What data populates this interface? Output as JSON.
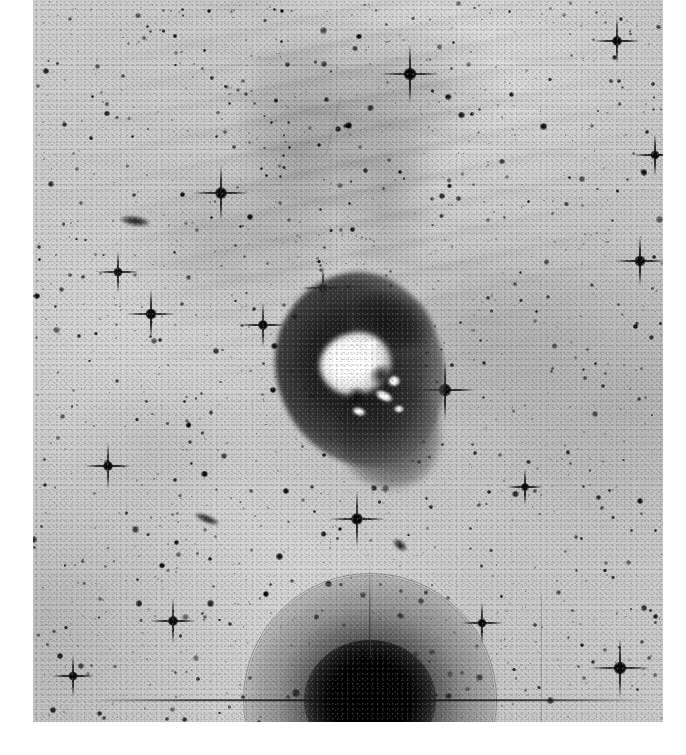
{
  "image": {
    "kind": "astronomical-photographic-plate",
    "rendering": "negative grayscale (stars dark on light sky)",
    "canvas_width": 686,
    "canvas_height": 755,
    "plate": {
      "left": 33,
      "top": 0,
      "width": 630,
      "height": 722
    },
    "margin_color": "#ffffff",
    "sky_background_color": "#c8c8c8",
    "star_color": "#111111",
    "nebula_core_color": "#ffffff",
    "nebula_envelope_color": "#1e1e1e"
  },
  "objects": {
    "central_nebula": {
      "label": "central star-forming nebula",
      "center_x": 360,
      "center_y": 370,
      "envelope_width": 168,
      "envelope_height": 196,
      "core_width": 72,
      "core_height": 62,
      "description": "bright saturated core with dark emission envelope and a horn-shaped extension toward the upper right"
    },
    "halo_star": {
      "label": "bright foreground star with scattered-light halo",
      "center_x": 370,
      "center_y": 700,
      "halo_diameter": 248,
      "description": "very bright star near the bottom edge, circular halo ring and horizontal/vertical diffraction spikes"
    },
    "galaxies": [
      {
        "label": "edge-on galaxy",
        "x": 207,
        "y": 519,
        "length": 26,
        "thickness": 8,
        "angle": 22
      },
      {
        "label": "faint elongated galaxy",
        "x": 135,
        "y": 221,
        "length": 30,
        "thickness": 10,
        "angle": 8
      },
      {
        "label": "diffuse smudge",
        "x": 400,
        "y": 545,
        "length": 16,
        "thickness": 9,
        "angle": 40
      }
    ],
    "bright_stars": [
      {
        "x": 410,
        "y": 74,
        "size": 13,
        "spikes": true
      },
      {
        "x": 617,
        "y": 41,
        "size": 10,
        "spikes": true
      },
      {
        "x": 221,
        "y": 193,
        "size": 12,
        "spikes": true
      },
      {
        "x": 151,
        "y": 314,
        "size": 11,
        "spikes": true
      },
      {
        "x": 118,
        "y": 272,
        "size": 9,
        "spikes": true
      },
      {
        "x": 263,
        "y": 325,
        "size": 10,
        "spikes": true
      },
      {
        "x": 323,
        "y": 288,
        "size": 9,
        "spikes": true
      },
      {
        "x": 445,
        "y": 390,
        "size": 13,
        "spikes": true
      },
      {
        "x": 357,
        "y": 519,
        "size": 12,
        "spikes": true
      },
      {
        "x": 620,
        "y": 668,
        "size": 13,
        "spikes": true
      },
      {
        "x": 640,
        "y": 261,
        "size": 11,
        "spikes": true
      },
      {
        "x": 655,
        "y": 155,
        "size": 9,
        "spikes": true
      },
      {
        "x": 482,
        "y": 623,
        "size": 9,
        "spikes": true
      },
      {
        "x": 173,
        "y": 621,
        "size": 10,
        "spikes": true
      },
      {
        "x": 73,
        "y": 676,
        "size": 9,
        "spikes": true
      },
      {
        "x": 108,
        "y": 466,
        "size": 10,
        "spikes": true
      },
      {
        "x": 525,
        "y": 487,
        "size": 8,
        "spikes": true
      },
      {
        "x": 296,
        "y": 693,
        "size": 8,
        "spikes": false
      }
    ],
    "nebulosity": {
      "label": "faint diffuse filamentary nebulosity",
      "region": "upper half of the plate, streaks running roughly north-south"
    },
    "plate_artifacts": [
      {
        "label": "vertical scratch",
        "x": 541,
        "y_from": 595,
        "y_to": 722
      },
      {
        "label": "horizontal halo spike",
        "x_from": 260,
        "x_to": 560,
        "y": 700
      }
    ]
  },
  "field": {
    "star_count_hint": 1400,
    "seed": 20240611
  }
}
